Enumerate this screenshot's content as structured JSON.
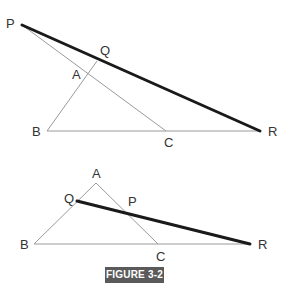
{
  "figure": {
    "caption": "FIGURE 3-2",
    "caption_bg": "#5a5a5a",
    "line_color_thin": "#9a9a9a",
    "line_color_thick": "#1a1a1a"
  },
  "top_diagram": {
    "labels": {
      "P": "P",
      "Q": "Q",
      "A": "A",
      "B": "B",
      "C": "C",
      "R": "R"
    },
    "points": {
      "P": [
        22,
        25
      ],
      "Q": [
        97,
        61
      ],
      "A": [
        88,
        73
      ],
      "B": [
        47,
        131
      ],
      "C": [
        166,
        131
      ],
      "R": [
        260,
        131
      ]
    },
    "description": "Line PR (transversal, thick) crosses triangle ABC extended; B-A extended meets PR at Q, P-C passes through A"
  },
  "bottom_diagram": {
    "labels": {
      "A": "A",
      "Q": "Q",
      "P": "P",
      "B": "B",
      "C": "C",
      "R": "R"
    },
    "points": {
      "A": [
        96,
        183
      ],
      "Q": [
        77,
        201
      ],
      "P": [
        124,
        212
      ],
      "B": [
        34,
        244
      ],
      "C": [
        158,
        244
      ],
      "R": [
        250,
        244
      ]
    },
    "description": "Triangle ABC with transversal QR (thick) crossing AB at Q, AC at P, and BC extended at R"
  }
}
